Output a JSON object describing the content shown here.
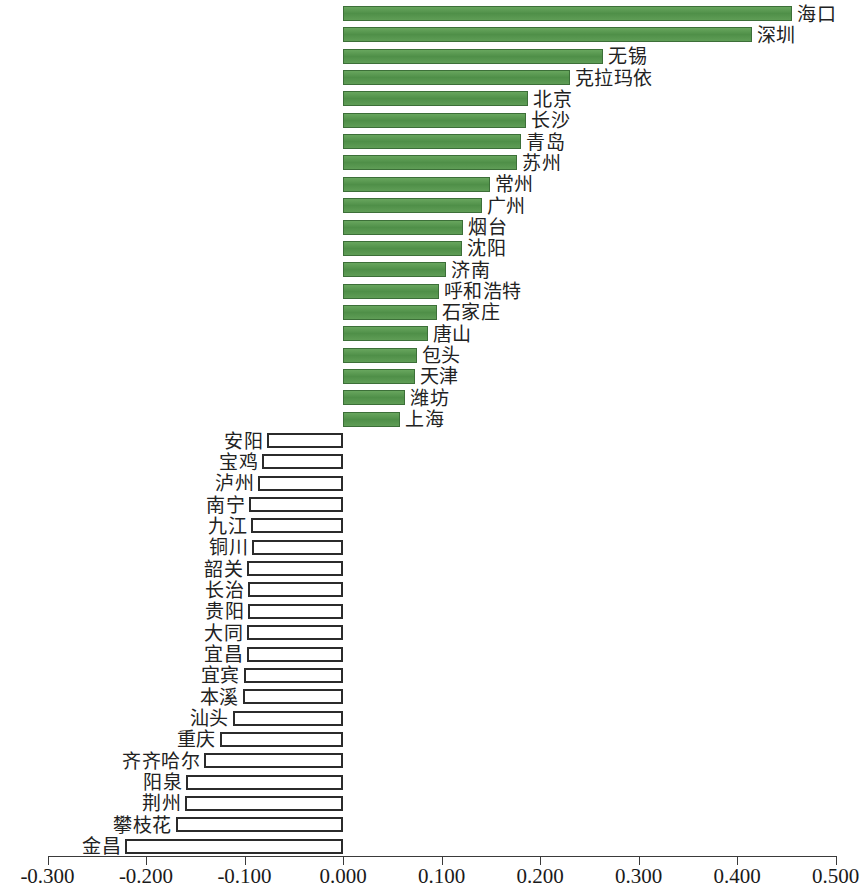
{
  "chart_data": {
    "type": "bar",
    "orientation": "horizontal",
    "title": "",
    "subtitle": "",
    "xlabel": "",
    "ylabel": "",
    "xlim": [
      -0.3,
      0.5
    ],
    "xticks": [
      -0.3,
      -0.2,
      -0.1,
      0.0,
      0.1,
      0.2,
      0.3,
      0.4,
      0.5
    ],
    "xtick_labels": [
      "-0.300",
      "-0.200",
      "-0.100",
      "0.000",
      "0.100",
      "0.200",
      "0.300",
      "0.400",
      "0.500"
    ],
    "grid": false,
    "legend": null,
    "colors": {
      "positive_fill": "#5a9a51",
      "positive_edge": "#3c6f38",
      "negative_fill": "#ffffff",
      "negative_edge": "#2b2b2b",
      "axis": "#3a3a3a",
      "text": "#1a1a1a"
    },
    "categories": [
      "海口",
      "深圳",
      "无锡",
      "克拉玛依",
      "北京",
      "长沙",
      "青岛",
      "苏州",
      "常州",
      "广州",
      "烟台",
      "沈阳",
      "济南",
      "呼和浩特",
      "石家庄",
      "唐山",
      "包头",
      "天津",
      "潍坊",
      "上海",
      "安阳",
      "宝鸡",
      "泸州",
      "南宁",
      "九江",
      "铜川",
      "韶关",
      "长治",
      "贵阳",
      "大同",
      "宜昌",
      "宜宾",
      "本溪",
      "汕头",
      "重庆",
      "齐齐哈尔",
      "阳泉",
      "荆州",
      "攀枝花",
      "金昌"
    ],
    "values": [
      0.456,
      0.415,
      0.264,
      0.23,
      0.188,
      0.186,
      0.181,
      0.177,
      0.149,
      0.141,
      0.122,
      0.121,
      0.105,
      0.097,
      0.095,
      0.086,
      0.075,
      0.073,
      0.063,
      0.058,
      -0.077,
      -0.082,
      -0.086,
      -0.095,
      -0.093,
      -0.092,
      -0.097,
      -0.096,
      -0.096,
      -0.097,
      -0.097,
      -0.101,
      -0.102,
      -0.112,
      -0.125,
      -0.141,
      -0.159,
      -0.16,
      -0.17,
      -0.221
    ]
  },
  "axis": {
    "tick_labels": [
      "-0.300",
      "-0.200",
      "-0.100",
      "0.000",
      "0.100",
      "0.200",
      "0.300",
      "0.400",
      "0.500"
    ]
  }
}
